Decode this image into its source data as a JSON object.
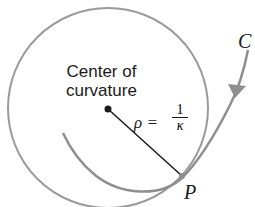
{
  "diagram": {
    "center_label_line1": "Center of",
    "center_label_line2": "curvature",
    "curve_label": "C",
    "point_label": "P",
    "radius_symbol": "ρ =",
    "fraction_numerator": "1",
    "fraction_denominator": "κ",
    "colors": {
      "circle": "#9a9a9a",
      "curve": "#8e8e8e",
      "radius_line": "#1a1a1a",
      "text": "#1a1a1a"
    }
  }
}
